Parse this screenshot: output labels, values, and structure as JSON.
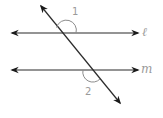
{
  "diagram": {
    "type": "parallel-lines-transversal",
    "lines": [
      {
        "id": "l",
        "label": "ℓ",
        "y": 33
      },
      {
        "id": "m",
        "label": "m",
        "y": 70
      }
    ],
    "transversal": {
      "from": [
        41,
        6
      ],
      "to": [
        120,
        103
      ]
    },
    "angles": [
      {
        "label": "1",
        "position": "above line ℓ, right of transversal"
      },
      {
        "label": "2",
        "position": "below line m, left of transversal"
      }
    ],
    "colors": {
      "line": "#2b2b2b",
      "arc": "#8c8c8c",
      "label": "#9a9a9a"
    }
  }
}
